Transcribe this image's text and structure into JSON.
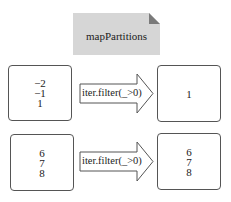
{
  "header": {
    "title": "mapPartitions"
  },
  "colors": {
    "note_fill": "#d6d6d6",
    "note_corner": "#7a7a7a",
    "stroke": "#555555",
    "background": "#ffffff"
  },
  "rows": [
    {
      "input": {
        "values": [
          "−2",
          "−1",
          "1"
        ]
      },
      "transform": {
        "label": "iter.filter(_>0)"
      },
      "output": {
        "values": [
          "1"
        ]
      }
    },
    {
      "input": {
        "values": [
          "6",
          "7",
          "8"
        ]
      },
      "transform": {
        "label": "iter.filter(_>0)"
      },
      "output": {
        "values": [
          "6",
          "7",
          "8"
        ]
      }
    }
  ]
}
